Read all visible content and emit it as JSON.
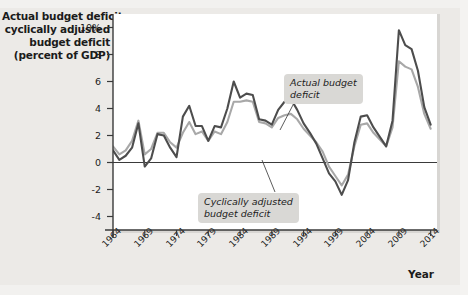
{
  "axis_title_lines": [
    "Actual budget deficit,",
    "cyclically adjusted",
    "budget deficit",
    "(percent of GDP)"
  ],
  "xaxis_label": "Year",
  "annotations": {
    "actual": [
      "Actual budget",
      "deficit"
    ],
    "cyclical": [
      "Cyclically adjusted",
      "budget deficit"
    ]
  },
  "colors": {
    "actual_line": "#4d4d4d",
    "cyclical_line": "#a8a8a8",
    "plot_background": "#ffffff",
    "page_background": "#eceae7",
    "callout_background": "#d9d8d5",
    "axis": "#3a3a3a"
  },
  "chart_data": {
    "type": "line",
    "title": "",
    "xlabel": "Year",
    "ylabel": "Actual budget deficit, cyclically adjusted budget deficit (percent of GDP)",
    "xlim": [
      1964,
      2015
    ],
    "ylim": [
      -5,
      11
    ],
    "yticks": [
      -4,
      -2,
      0,
      2,
      4,
      6,
      8,
      10
    ],
    "ytick_labels": [
      "-4",
      "-2",
      "0",
      "2",
      "4",
      "6",
      "8",
      "10%"
    ],
    "xticks": [
      1964,
      1969,
      1974,
      1979,
      1984,
      1989,
      1994,
      1999,
      2004,
      2009,
      2014
    ],
    "xtick_labels": [
      "1964",
      "1969",
      "1974",
      "1979",
      "1984",
      "1989",
      "1994",
      "1999",
      "2004",
      "2009",
      "2014"
    ],
    "grid": false,
    "zero_line": true,
    "legend_position": "annotations",
    "x": [
      1964,
      1965,
      1966,
      1967,
      1968,
      1969,
      1970,
      1971,
      1972,
      1973,
      1974,
      1975,
      1976,
      1977,
      1978,
      1979,
      1980,
      1981,
      1982,
      1983,
      1984,
      1985,
      1986,
      1987,
      1988,
      1989,
      1990,
      1991,
      1992,
      1993,
      1994,
      1995,
      1996,
      1997,
      1998,
      1999,
      2000,
      2001,
      2002,
      2003,
      2004,
      2005,
      2006,
      2007,
      2008,
      2009,
      2010,
      2011,
      2012,
      2013,
      2014
    ],
    "series": [
      {
        "name": "Actual budget deficit",
        "color": "#4d4d4d",
        "values": [
          0.9,
          0.2,
          0.5,
          1.1,
          2.9,
          -0.3,
          0.3,
          2.1,
          2.0,
          1.1,
          0.4,
          3.4,
          4.2,
          2.7,
          2.7,
          1.6,
          2.7,
          2.6,
          4.0,
          6.0,
          4.8,
          5.1,
          5.0,
          3.2,
          3.1,
          2.8,
          3.9,
          4.5,
          4.7,
          3.9,
          2.9,
          2.2,
          1.4,
          0.3,
          -0.8,
          -1.4,
          -2.4,
          -1.3,
          1.5,
          3.4,
          3.5,
          2.6,
          1.9,
          1.2,
          3.1,
          9.8,
          8.7,
          8.4,
          6.8,
          4.1,
          2.8
        ]
      },
      {
        "name": "Cyclically adjusted budget deficit",
        "color": "#a8a8a8",
        "values": [
          1.2,
          0.6,
          0.9,
          1.6,
          3.1,
          0.6,
          1.0,
          2.2,
          2.2,
          1.5,
          1.1,
          2.2,
          3.0,
          2.1,
          2.3,
          1.6,
          2.3,
          2.1,
          3.0,
          4.5,
          4.5,
          4.6,
          4.5,
          3.0,
          2.9,
          2.6,
          3.3,
          3.5,
          3.6,
          3.2,
          2.5,
          2.0,
          1.5,
          0.8,
          -0.3,
          -1.0,
          -1.7,
          -0.9,
          1.2,
          2.8,
          2.9,
          2.2,
          1.7,
          1.2,
          2.6,
          7.5,
          7.1,
          6.9,
          5.6,
          3.6,
          2.5
        ]
      }
    ]
  }
}
